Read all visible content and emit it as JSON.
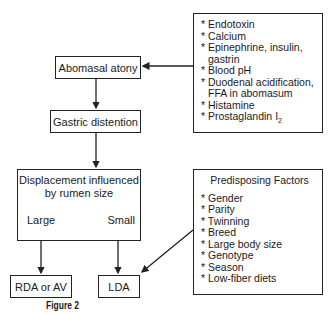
{
  "diagram": {
    "flow": {
      "abomasal_atony": "Abomasal atony",
      "gastric_distention": "Gastric distention",
      "displacement": {
        "title_line1": "Displacement influenced",
        "title_line2": "by rumen size",
        "large": "Large",
        "small": "Small"
      },
      "rda": "RDA or AV",
      "lda": "LDA"
    },
    "causes_box": {
      "items": [
        {
          "text": "* Endotoxin"
        },
        {
          "text": "* Calcium"
        },
        {
          "text": "* Epinephrine, insulin,"
        },
        {
          "text": "gastrin",
          "continuation": true
        },
        {
          "text": "* Blood pH"
        },
        {
          "text": "* Duodenal acidification,"
        },
        {
          "text": "FFA in abomasum",
          "continuation": true
        },
        {
          "text": "* Histamine"
        },
        {
          "text": "* Prostaglandin I",
          "subscript": "2"
        }
      ]
    },
    "predisposing_box": {
      "title": "Predisposing Factors",
      "items": [
        "* Gender",
        "* Parity",
        "* Twinning",
        "* Breed",
        "* Large body size",
        "* Genotype",
        "* Season",
        "* Low-fiber diets"
      ]
    },
    "caption": "Figure 2"
  }
}
